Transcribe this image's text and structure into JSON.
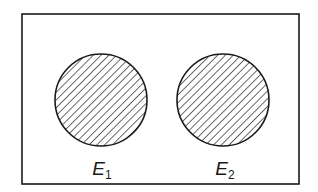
{
  "diagram": {
    "type": "venn",
    "universe": {
      "shape": "rectangle",
      "x": 22,
      "y": 14,
      "width": 277,
      "height": 170
    },
    "sets": [
      {
        "name": "E",
        "subscript": "1",
        "cx": 101,
        "cy": 100,
        "r": 46,
        "fill": "hatched",
        "label_x": 102,
        "label_y": 160
      },
      {
        "name": "E",
        "subscript": "2",
        "cx": 223,
        "cy": 100,
        "r": 46,
        "fill": "hatched",
        "label_x": 225,
        "label_y": 160
      }
    ],
    "colors": {
      "stroke": "#1a1a1a",
      "background": "#ffffff"
    }
  }
}
